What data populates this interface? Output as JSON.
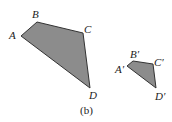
{
  "figure": {
    "caption": "(b)",
    "colors": {
      "fill": "#8c8c8c",
      "stroke": "#333333",
      "text": "#222222"
    },
    "large_quadrilateral": {
      "vertices": [
        {
          "label": "A",
          "x": 21,
          "y": 36
        },
        {
          "label": "B",
          "x": 37,
          "y": 22
        },
        {
          "label": "C",
          "x": 83,
          "y": 33
        },
        {
          "label": "D",
          "x": 90,
          "y": 88
        }
      ]
    },
    "small_quadrilateral": {
      "vertices": [
        {
          "label": "A′",
          "x": 127,
          "y": 66
        },
        {
          "label": "B′",
          "x": 133,
          "y": 61
        },
        {
          "label": "C′",
          "x": 153,
          "y": 64
        },
        {
          "label": "D′",
          "x": 156,
          "y": 88
        }
      ]
    }
  }
}
